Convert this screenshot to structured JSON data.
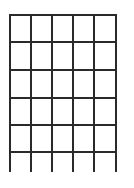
{
  "figure": {
    "type": "grid",
    "line_color": "#2a2a2a",
    "background": "#ffffff",
    "columns": 5,
    "closed_rows": 5,
    "open_bottom_row": true,
    "vertical_lines_x": [
      9,
      30,
      51,
      72,
      93,
      115
    ],
    "horizontal_lines_y": [
      14,
      41,
      69,
      97,
      124,
      151
    ],
    "vertical_top": 14,
    "vertical_bottom": 172
  }
}
